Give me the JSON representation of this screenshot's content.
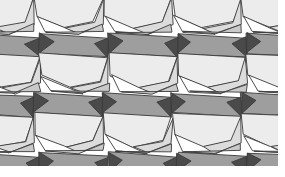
{
  "figure": {
    "name": "pentagonal-tessellation",
    "width": 285,
    "height": 177,
    "background": "#ffffff"
  },
  "palette": {
    "dark": "#4a4a4a",
    "medium": "#9e9e9e",
    "light": "#c9c9c9",
    "lighter": "#dcdcdc",
    "pale": "#ececec",
    "white": "#ffffff",
    "stroke": "#3a3a3a"
  },
  "geometry": {
    "period_x": 69.0,
    "period_y": 59.5,
    "origin_x": -35.0,
    "origin_y": -28.0,
    "columns": 6,
    "rows": 5,
    "stroke_width": 0.9,
    "content_clip": {
      "x": 0,
      "y": 0,
      "width": 278,
      "height": 166
    }
  },
  "unit_cell": {
    "description": "One translational unit of the tiling: a band of medium-gray quadrilaterals, pale pentagons, a white wedge and dark bowtie triangles meeting at a pinch vertex.",
    "tiles": [
      {
        "name": "upper-medium-band",
        "fill_key": "medium",
        "points": "0,2 69,6 69,26 0,22"
      },
      {
        "name": "upper-dark-wedge-left",
        "fill_key": "dark",
        "points": "0,2 14,10 0,22"
      },
      {
        "name": "upper-dark-wedge-right",
        "fill_key": "dark",
        "points": "69,6 55,12 69,26"
      },
      {
        "name": "mid-pale-pentagon",
        "fill_key": "pale",
        "points": "0,22 69,26 60,50 30,56 2,44"
      },
      {
        "name": "mid-lighter-quad",
        "fill_key": "lighter",
        "points": "30,56 60,50 69,26 69,52 44,62"
      },
      {
        "name": "lower-white-wedge",
        "fill_key": "white",
        "points": "2,44 30,56 44,62 12,60"
      },
      {
        "name": "lower-light-quad",
        "fill_key": "light",
        "points": "12,60 44,62 69,52 69,60"
      }
    ]
  },
  "legend": {
    "note": "No text labels appear in this image."
  }
}
